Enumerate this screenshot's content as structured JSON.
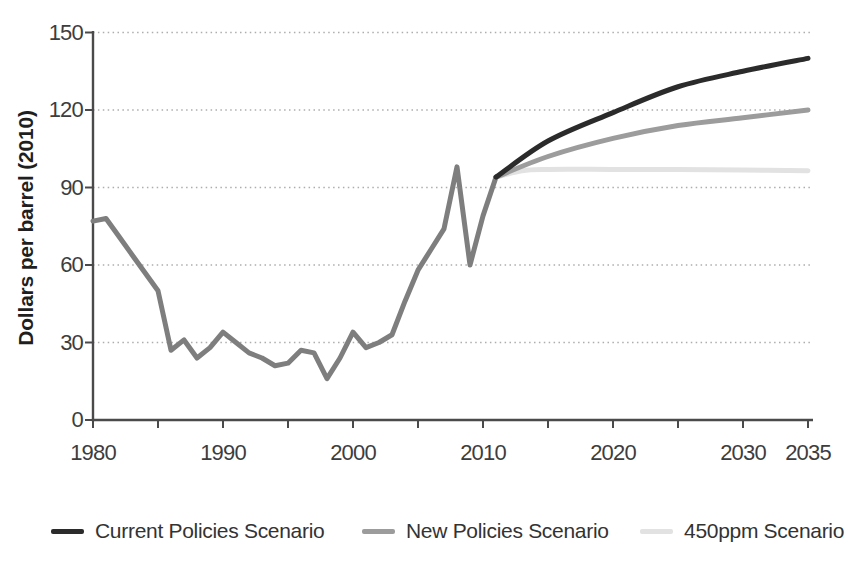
{
  "chart_data": {
    "type": "line",
    "title": "",
    "xlabel": "",
    "ylabel": "Dollars per barrel (2010)",
    "xlim": [
      1980,
      2035
    ],
    "ylim": [
      0,
      150
    ],
    "yticks": [
      0,
      30,
      60,
      90,
      120,
      150
    ],
    "xtick_minor_interval": 5,
    "xtick_labels": [
      1980,
      1990,
      2000,
      2010,
      2020,
      2030,
      2035
    ],
    "grid": "horizontal-dotted",
    "legend_position": "bottom",
    "colors": {
      "axis": "#4a4a4a",
      "grid": "#adadad",
      "tick_text": "#3d3d3d"
    },
    "series": [
      {
        "name": "Historical price",
        "in_legend": false,
        "color": "#7e7e7e",
        "smooth": false,
        "x": [
          1980,
          1981,
          1982,
          1983,
          1984,
          1985,
          1986,
          1987,
          1988,
          1989,
          1990,
          1991,
          1992,
          1993,
          1994,
          1995,
          1996,
          1997,
          1998,
          1999,
          2000,
          2001,
          2002,
          2003,
          2004,
          2005,
          2006,
          2007,
          2008,
          2009,
          2010,
          2011
        ],
        "y": [
          77,
          78,
          71,
          64,
          57,
          50,
          27,
          31,
          24,
          28,
          34,
          30,
          26,
          24,
          21,
          22,
          27,
          26,
          16,
          24,
          34,
          28,
          30,
          33,
          46,
          58,
          66,
          74,
          98,
          60,
          79,
          94
        ]
      },
      {
        "name": "Current Policies Scenario",
        "in_legend": true,
        "color": "#2b2b2b",
        "smooth": true,
        "x": [
          2011,
          2015,
          2020,
          2025,
          2030,
          2035
        ],
        "y": [
          94,
          108,
          119,
          129,
          135,
          140
        ]
      },
      {
        "name": "New Policies Scenario",
        "in_legend": true,
        "color": "#9c9c9c",
        "smooth": true,
        "x": [
          2011,
          2015,
          2020,
          2025,
          2030,
          2035
        ],
        "y": [
          94,
          102,
          109,
          114,
          117,
          120
        ]
      },
      {
        "name": "450ppm Scenario",
        "in_legend": true,
        "color": "#e2e2e2",
        "smooth": true,
        "x": [
          2011,
          2013,
          2015,
          2020,
          2025,
          2030,
          2035
        ],
        "y": [
          94,
          96.5,
          97,
          97,
          97,
          96.8,
          96.5
        ]
      }
    ]
  }
}
